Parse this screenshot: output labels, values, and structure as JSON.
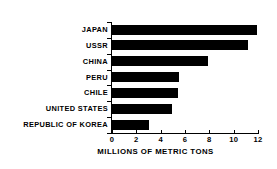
{
  "chart_data": {
    "type": "bar",
    "orientation": "horizontal",
    "title": "",
    "subtitle": "",
    "xlabel": "MILLIONS OF METRIC TONS",
    "ylabel": "",
    "categories": [
      "JAPAN",
      "USSR",
      "CHINA",
      "PERU",
      "CHILE",
      "UNITED STATES",
      "REPUBLIC OF KOREA"
    ],
    "values": [
      11.9,
      11.2,
      7.9,
      5.5,
      5.4,
      4.9,
      3.0
    ],
    "xlim": [
      0,
      12
    ],
    "xticks": [
      0,
      2,
      4,
      6,
      8,
      10,
      12
    ],
    "xticklabels": [
      "0",
      "2",
      "4",
      "6",
      "8",
      "10",
      "12"
    ],
    "grid": false,
    "legend": false,
    "legend_position": "none",
    "bar_color": "#000000",
    "background_color": "#ffffff",
    "axis_color": "#000000"
  }
}
